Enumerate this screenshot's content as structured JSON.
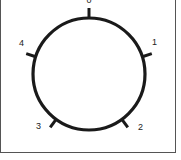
{
  "diagram": {
    "type": "dial",
    "positions": [
      {
        "label": "0",
        "angle_deg": 0
      },
      {
        "label": "1",
        "angle_deg": 72
      },
      {
        "label": "2",
        "angle_deg": 144
      },
      {
        "label": "3",
        "angle_deg": 216
      },
      {
        "label": "4",
        "angle_deg": 288
      }
    ],
    "colors": {
      "stroke": "#1a1a1a",
      "border": "#555555",
      "background": "#ffffff"
    }
  }
}
